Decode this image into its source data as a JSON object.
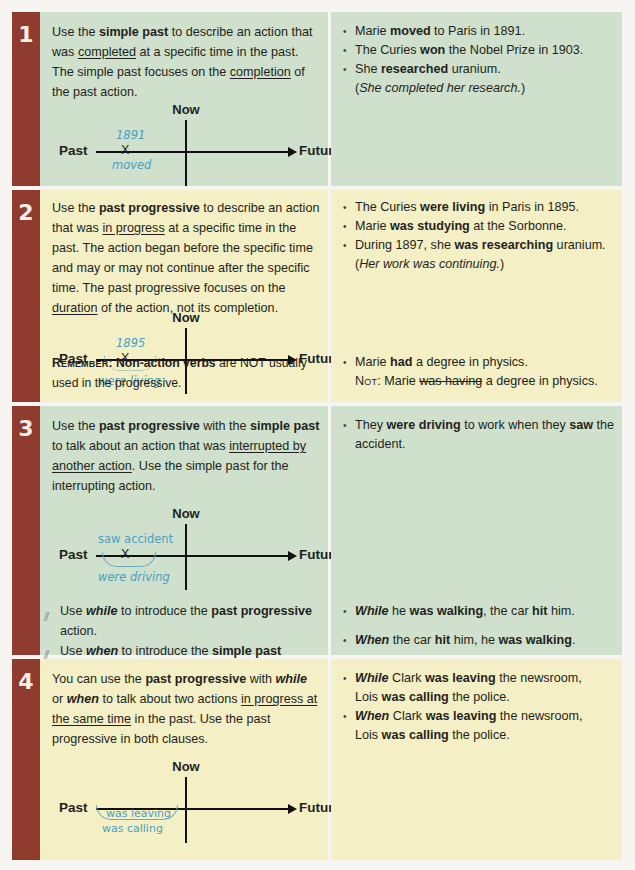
{
  "colors": {
    "number_bar": "#8f3b2f",
    "green_row": "#cfe0cc",
    "yellow_row": "#f4efc4",
    "handwriting": "#4a9fc4"
  },
  "timeline": {
    "now": "Now",
    "past": "Past",
    "future": "Future",
    "x": "X"
  },
  "rows": [
    {
      "number": "1",
      "left": {
        "p1": "Use the ",
        "b1": "simple past",
        "p2": " to describe an action that was ",
        "u1": "completed",
        "p3": " at a specific time in the past. The simple past focuses on the ",
        "u2": "completion",
        "p4": " of the past action.",
        "timeline_above": "1891",
        "timeline_below": "moved"
      },
      "right": {
        "examples": [
          {
            "a": "Marie ",
            "b": "moved",
            "c": " to Paris in 1891."
          },
          {
            "a": "The Curies ",
            "b": "won",
            "c": " the Nobel Prize in 1903."
          },
          {
            "a": "She ",
            "b": "researched",
            "c": " uranium."
          }
        ],
        "note": "She completed her research."
      }
    },
    {
      "number": "2",
      "left": {
        "p1": "Use the ",
        "b1": "past progressive",
        "p2": " to describe an action that was ",
        "u1": "in progress",
        "p3": " at a specific time in the past. The action began before the specific time and may or may not continue after the specific time. The past progressive focuses on the ",
        "u2": "duration",
        "p4": " of the action, not its completion.",
        "timeline_above": "1895",
        "timeline_below": "were living",
        "remember_label": "Remember:",
        "remember_bold": "Non-action verbs",
        "remember_text": " are NOT usually used in the progressive."
      },
      "right": {
        "examples": [
          {
            "a": "The Curies ",
            "b": "were living",
            "c": " in Paris in 1895."
          },
          {
            "a": "Marie ",
            "b": "was studying",
            "c": " at the Sorbonne."
          },
          {
            "a": "During 1897, she ",
            "b": "was researching",
            "c": " uranium."
          }
        ],
        "note": "Her work was continuing.",
        "nonaction": {
          "a": "Marie ",
          "b": "had",
          "c": " a degree in physics."
        },
        "not_label": "Not",
        "not_a": ": Marie ",
        "not_strike": "was having",
        "not_c": " a degree in physics."
      }
    },
    {
      "number": "3",
      "left": {
        "p1": "Use the ",
        "b1": "past progressive",
        "p2": " with the ",
        "b2": "simple past",
        "p3": " to talk about an action that was ",
        "u1": "interrupted by another action",
        "p4": ". Use the simple past for the interrupting action.",
        "timeline_above": "saw accident",
        "timeline_below": "were driving",
        "bullet1": {
          "a": "Use ",
          "bi": "while",
          "c": " to introduce the ",
          "b": "past progressive",
          "d": " action."
        },
        "bullet2": {
          "a": "Use ",
          "bi": "when",
          "c": " to introduce the ",
          "b": "simple past",
          "d": " action."
        }
      },
      "right": {
        "example": {
          "a": "They ",
          "b": "were driving",
          "c": " to work when they ",
          "d": "saw",
          "e": " the accident."
        },
        "while_ex": {
          "bi": "While",
          "a": " he ",
          "b": "was walking",
          "c": ", the car ",
          "d": "hit",
          "e": " him."
        },
        "when_ex": {
          "bi": "When",
          "a": " the car ",
          "b": "hit",
          "c": " him, he ",
          "d": "was walking",
          "e": "."
        }
      }
    },
    {
      "number": "4",
      "left": {
        "p1": "You can use the ",
        "b1": "past progressive",
        "p2": " with ",
        "bi1": "while",
        "p3": " or ",
        "bi2": "when",
        "p4": " to talk about two actions ",
        "u1": "in progress at the same time",
        "p5": " in the past. Use the past progressive in both clauses.",
        "timeline_above": "was leaving",
        "timeline_below": "was calling"
      },
      "right": {
        "examples": [
          {
            "bi": "While",
            "a": " Clark ",
            "b": "was leaving",
            "c": " the newsroom,",
            "d": "Lois ",
            "e": "was calling",
            "f": " the police."
          },
          {
            "bi": "When",
            "a": " Clark ",
            "b": "was leaving",
            "c": " the newsroom,",
            "d": "Lois ",
            "e": "was calling",
            "f": " the police."
          }
        ]
      }
    }
  ]
}
